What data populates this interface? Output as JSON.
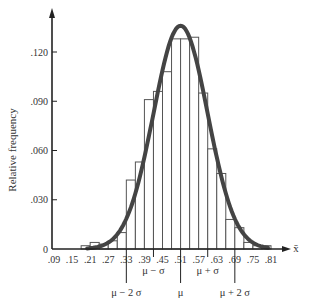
{
  "chart_data": {
    "type": "bar",
    "title": "",
    "xlabel": "x̄",
    "ylabel": "Relative frequency",
    "xlim": [
      0.09,
      0.84
    ],
    "ylim": [
      0,
      0.14
    ],
    "grid": false,
    "legend": null,
    "bin_width": 0.03,
    "bin_starts": [
      0.18,
      0.21,
      0.24,
      0.27,
      0.3,
      0.33,
      0.36,
      0.39,
      0.42,
      0.45,
      0.48,
      0.51,
      0.54,
      0.57,
      0.6,
      0.63,
      0.66,
      0.69,
      0.72,
      0.75,
      0.78
    ],
    "values": [
      0.002,
      0.004,
      0.003,
      0.005,
      0.01,
      0.042,
      0.053,
      0.091,
      0.096,
      0.108,
      0.128,
      0.128,
      0.129,
      0.095,
      0.061,
      0.046,
      0.018,
      0.013,
      0.004,
      0.002,
      0.002
    ],
    "x_ticks": [
      ".09",
      ".15",
      ".21",
      ".27",
      ".33",
      ".39",
      ".45",
      ".51",
      ".57",
      ".63",
      ".69",
      ".75",
      ".81"
    ],
    "y_ticks": [
      {
        "value": 0,
        "label": "0"
      },
      {
        "value": 0.03,
        "label": ".030"
      },
      {
        "value": 0.06,
        "label": ".060"
      },
      {
        "value": 0.09,
        "label": ".090"
      },
      {
        "value": 0.12,
        "label": ".120"
      }
    ],
    "normal_curve": {
      "mean": 0.51,
      "sd": 0.09,
      "peak": 0.136
    },
    "annotations": [
      {
        "x": 0.33,
        "label": "μ − 2 σ",
        "level": 2
      },
      {
        "x": 0.42,
        "label": "μ − σ",
        "level": 1
      },
      {
        "x": 0.51,
        "label": "μ",
        "level": 2
      },
      {
        "x": 0.6,
        "label": "μ + σ",
        "level": 1
      },
      {
        "x": 0.69,
        "label": "μ + 2 σ",
        "level": 2
      }
    ]
  },
  "labels": {
    "ylabel": "Relative frequency",
    "xlabel": "x̄"
  },
  "colors": {
    "bar_fill": "#ffffff",
    "bar_stroke": "#555555",
    "curve": "#444444",
    "axis": "#222222"
  }
}
